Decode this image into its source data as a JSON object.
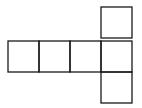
{
  "diagram": {
    "type": "cube-net",
    "stroke_color": "#1a1a1a",
    "background": "#ffffff",
    "square_size": 31,
    "squares": [
      {
        "id": "row-1",
        "x": 8,
        "y": 41
      },
      {
        "id": "row-2",
        "x": 39,
        "y": 41
      },
      {
        "id": "row-3",
        "x": 70,
        "y": 41
      },
      {
        "id": "row-4",
        "x": 101,
        "y": 41
      },
      {
        "id": "top",
        "x": 101,
        "y": 7
      },
      {
        "id": "bottom",
        "x": 101,
        "y": 72
      }
    ]
  }
}
